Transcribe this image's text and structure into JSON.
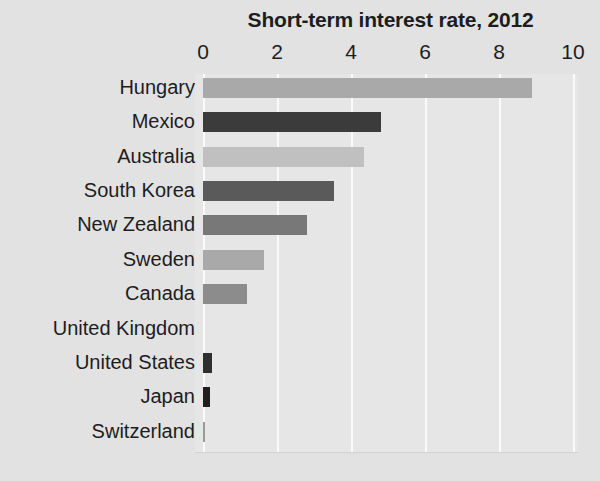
{
  "chart_data": {
    "type": "bar",
    "orientation": "horizontal",
    "title": "Short-term interest rate, 2012",
    "xlabel": "",
    "ylabel": "",
    "xlim": [
      0,
      10
    ],
    "xticks": [
      0,
      2,
      4,
      6,
      8,
      10
    ],
    "grid": true,
    "legend": "none",
    "categories": [
      "Hungary",
      "Mexico",
      "Australia",
      "South Korea",
      "New Zealand",
      "Sweden",
      "Canada",
      "United Kingdom",
      "United States",
      "Japan",
      "Switzerland"
    ],
    "values": [
      8.9,
      4.8,
      4.35,
      3.55,
      2.8,
      1.65,
      1.2,
      0.0,
      0.25,
      0.2,
      0.05
    ],
    "bar_colors": [
      "#a9a9a9",
      "#3b3b3b",
      "#c0c0c0",
      "#5a5a5a",
      "#787878",
      "#a9a9a9",
      "#8c8c8c",
      "#8c8c8c",
      "#2f2f2f",
      "#1f1f1f",
      "#9a9a9a"
    ]
  },
  "style": {
    "background": "#e2e2e2",
    "plot_background": "#e6e6e6",
    "gridline_color": "#fbfbfb",
    "text_color": "#1d1d1d"
  }
}
